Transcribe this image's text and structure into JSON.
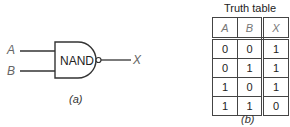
{
  "figure_a": {
    "gate_label": "NAND",
    "input_a": "A",
    "input_b": "B",
    "output": "X",
    "caption": "(a)"
  },
  "figure_b": {
    "title": "Truth table",
    "headers": [
      "A",
      "B",
      "X"
    ],
    "rows": [
      [
        "0",
        "0",
        "1"
      ],
      [
        "0",
        "1",
        "1"
      ],
      [
        "1",
        "0",
        "1"
      ],
      [
        "1",
        "1",
        "0"
      ]
    ],
    "caption": "(b)"
  }
}
